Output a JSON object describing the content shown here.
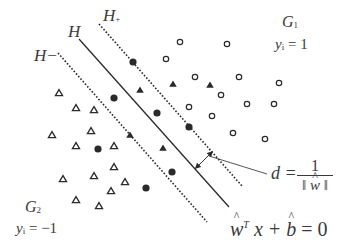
{
  "labels": {
    "H_minus": "H−",
    "H": "H",
    "H_plus_main": "H",
    "H_plus_sub": "+",
    "G1_main": "G",
    "G1_sub": "1",
    "G1_eq_var": "y",
    "G1_eq_sub": "i",
    "G1_eq_rhs": " = 1",
    "G2_main": "G",
    "G2_sub": "2",
    "G2_eq_var": "y",
    "G2_eq_sub": "i",
    "G2_eq_rhs": " = −1",
    "distance_lhs": "d =",
    "distance_num": "1",
    "distance_den_left": "‖ ",
    "distance_den_var": "w",
    "distance_den_right": " ‖",
    "hyperplane_w": "w",
    "hyperplane_T": "T",
    "hyperplane_x": " x + ",
    "hyperplane_b": "b",
    "hyperplane_rhs": " = 0"
  },
  "lines": {
    "H_plus": {
      "x1": 99,
      "y1": 24,
      "x2": 242,
      "y2": 186,
      "style": "dotted"
    },
    "H": {
      "x1": 79,
      "y1": 39,
      "x2": 229,
      "y2": 207,
      "style": "solid"
    },
    "H_minus": {
      "x1": 58,
      "y1": 53,
      "x2": 207,
      "y2": 222,
      "style": "dotted"
    },
    "margin_arrow": {
      "x1": 197,
      "y1": 167,
      "x2": 211,
      "y2": 153
    },
    "leader": {
      "x1": 209,
      "y1": 156,
      "x2": 267,
      "y2": 174
    }
  },
  "points": {
    "open_circles": [
      [
        180,
        42
      ],
      [
        227,
        44
      ],
      [
        166,
        59
      ],
      [
        195,
        77
      ],
      [
        239,
        77
      ],
      [
        279,
        83
      ],
      [
        221,
        95
      ],
      [
        247,
        104
      ],
      [
        274,
        104
      ],
      [
        189,
        107
      ],
      [
        212,
        116
      ],
      [
        233,
        133
      ],
      [
        265,
        139
      ]
    ],
    "filled_circles": [
      [
        133,
        62
      ],
      [
        114,
        98
      ],
      [
        157,
        113
      ],
      [
        189,
        127
      ],
      [
        98,
        149
      ],
      [
        172,
        172
      ],
      [
        146,
        188
      ]
    ],
    "open_triangles": [
      [
        59,
        93
      ],
      [
        76,
        108
      ],
      [
        94,
        110
      ],
      [
        52,
        135
      ],
      [
        91,
        131
      ],
      [
        76,
        146
      ],
      [
        114,
        146
      ],
      [
        114,
        167
      ],
      [
        63,
        179
      ],
      [
        94,
        176
      ],
      [
        125,
        182
      ],
      [
        111,
        191
      ],
      [
        76,
        200
      ],
      [
        99,
        206
      ]
    ],
    "filled_triangles": [
      [
        140,
        90
      ],
      [
        173,
        84
      ],
      [
        210,
        85
      ],
      [
        130,
        135
      ],
      [
        163,
        148
      ]
    ]
  },
  "colors": {
    "ink": "#2a2a2a",
    "text": "#3a3a3a",
    "background": "#ffffff"
  }
}
